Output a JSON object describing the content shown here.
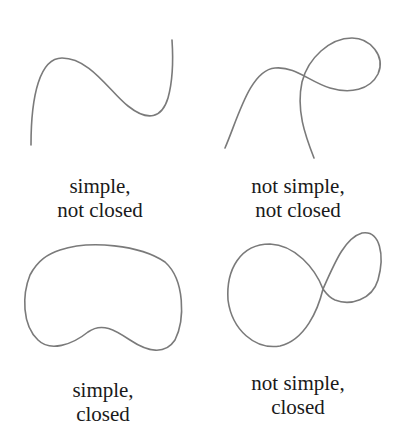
{
  "panels": [
    {
      "id": "simple-not-closed",
      "caption_line1": "simple,",
      "caption_line2": "not closed"
    },
    {
      "id": "not-simple-not-closed",
      "caption_line1": "not simple,",
      "caption_line2": "not closed"
    },
    {
      "id": "simple-closed",
      "caption_line1": "simple,",
      "caption_line2": "closed"
    },
    {
      "id": "not-simple-closed",
      "caption_line1": "not simple,",
      "caption_line2": "closed"
    }
  ],
  "colors": {
    "curve": "#7a7a7a",
    "text": "#1a1a1a",
    "background": "#ffffff"
  }
}
